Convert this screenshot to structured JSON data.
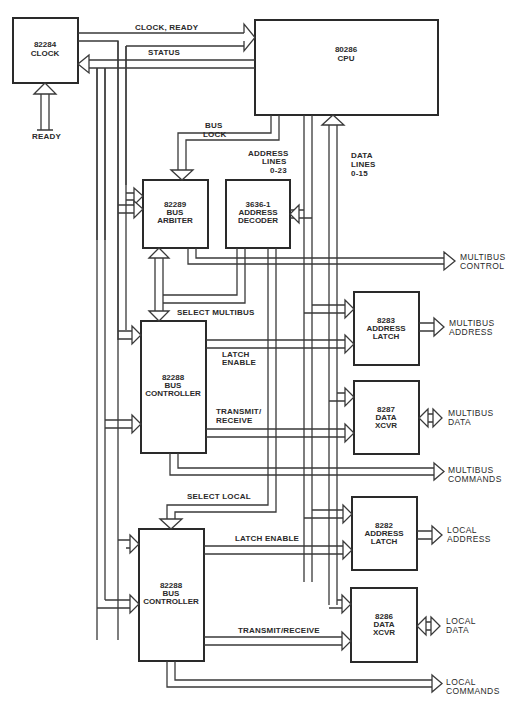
{
  "diagram": {
    "colors": {
      "ink": "#2a2a2a",
      "background": "#ffffff"
    },
    "blocks": [
      {
        "id": "clock",
        "lines": [
          "82284",
          "CLOCK"
        ],
        "x": 13,
        "y": 18,
        "w": 65,
        "h": 65
      },
      {
        "id": "cpu",
        "lines": [
          "80286",
          "CPU"
        ],
        "x": 255,
        "y": 20,
        "w": 183,
        "h": 95
      },
      {
        "id": "arbiter",
        "lines": [
          "82289",
          "BUS",
          "ARBITER"
        ],
        "x": 143,
        "y": 180,
        "w": 65,
        "h": 68
      },
      {
        "id": "decoder",
        "lines": [
          "3636-1",
          "ADDRESS",
          "DECODER"
        ],
        "x": 226,
        "y": 180,
        "w": 64,
        "h": 68
      },
      {
        "id": "mb-controller",
        "lines": [
          "82288",
          "BUS",
          "CONTROLLER"
        ],
        "x": 141,
        "y": 321,
        "w": 65,
        "h": 132
      },
      {
        "id": "mb-latch",
        "lines": [
          "8283",
          "ADDRESS",
          "LATCH"
        ],
        "x": 354,
        "y": 292,
        "w": 65,
        "h": 73
      },
      {
        "id": "mb-xcvr",
        "lines": [
          "8287",
          "DATA",
          "XCVR"
        ],
        "x": 354,
        "y": 381,
        "w": 65,
        "h": 73
      },
      {
        "id": "loc-controller",
        "lines": [
          "82288",
          "BUS",
          "CONTROLLER"
        ],
        "x": 139,
        "y": 529,
        "w": 65,
        "h": 132
      },
      {
        "id": "loc-latch",
        "lines": [
          "8282",
          "ADDRESS",
          "LATCH"
        ],
        "x": 352,
        "y": 497,
        "w": 65,
        "h": 73
      },
      {
        "id": "loc-xcvr",
        "lines": [
          "8286",
          "DATA",
          "XCVR"
        ],
        "x": 351,
        "y": 588,
        "w": 66,
        "h": 74
      }
    ],
    "signal_labels": {
      "clock_ready": "CLOCK, READY",
      "status": "STATUS",
      "ready_in": "READY",
      "bus_lock_1": "BUS",
      "bus_lock_2": "LOCK",
      "address_lines_1": "ADDRESS",
      "address_lines_2": "LINES",
      "address_lines_3": "0-23",
      "data_lines_1": "DATA",
      "data_lines_2": "LINES",
      "data_lines_3": "0-15",
      "select_multibus": "SELECT MULTIBUS",
      "latch_enable_1": "LATCH",
      "latch_enable_2": "ENABLE",
      "transmit_receive_1": "TRANSMIT/",
      "transmit_receive_2": "RECEIVE",
      "select_local": "SELECT LOCAL",
      "latch_enable_local": "LATCH ENABLE",
      "transmit_receive_local": "TRANSMIT/RECEIVE"
    },
    "outputs": {
      "multibus_control_1": "MULTIBUS",
      "multibus_control_2": "CONTROL",
      "multibus_address_1": "MULTIBUS",
      "multibus_address_2": "ADDRESS",
      "multibus_data_1": "MULTIBUS",
      "multibus_data_2": "DATA",
      "multibus_commands_1": "MULTIBUS",
      "multibus_commands_2": "COMMANDS",
      "local_address_1": "LOCAL",
      "local_address_2": "ADDRESS",
      "local_data_1": "LOCAL",
      "local_data_2": "DATA",
      "local_commands_1": "LOCAL",
      "local_commands_2": "COMMANDS"
    }
  }
}
